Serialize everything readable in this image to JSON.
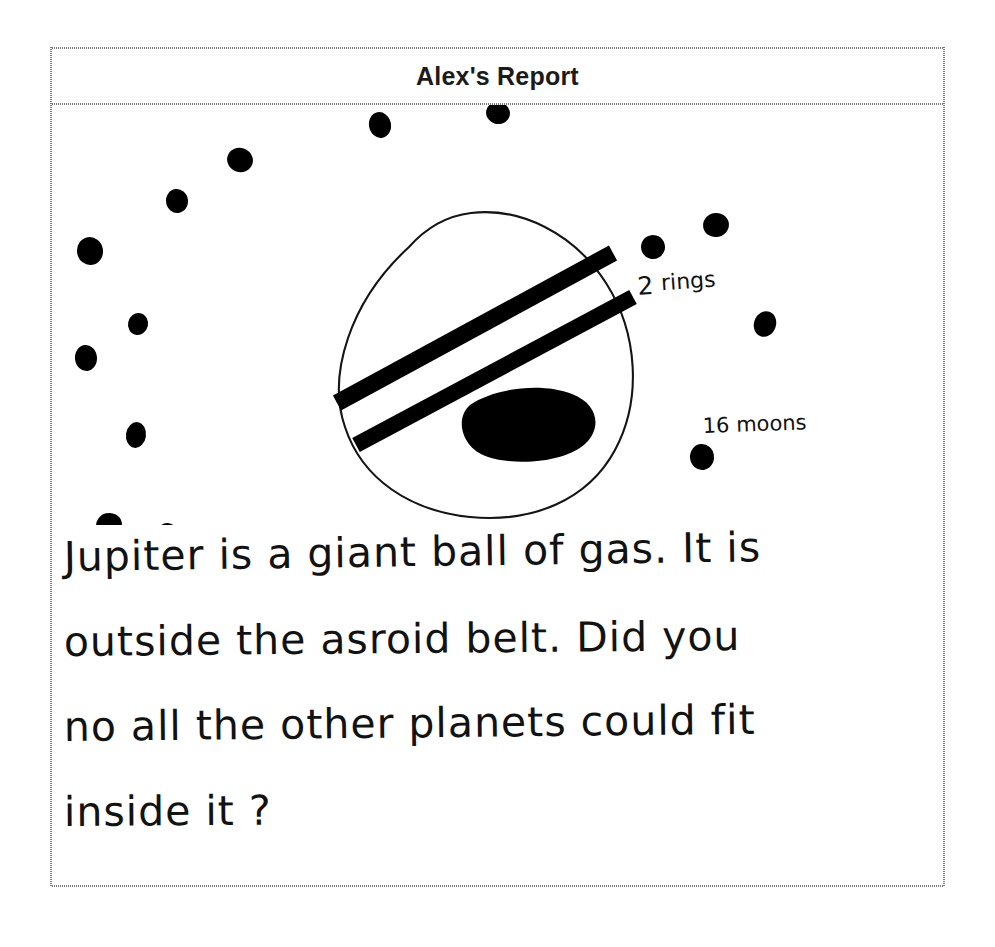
{
  "document": {
    "title": "Alex's Report",
    "type": "handwritten-student-worksheet",
    "subject": "Jupiter"
  },
  "drawing": {
    "name": "jupiter-diagram",
    "planet": {
      "name": "jupiter-body",
      "shape": "hand-drawn-circle",
      "fill": "none",
      "stroke": "#111111"
    },
    "rings": {
      "name": "jupiter-rings",
      "count": 2,
      "style": "thick-diagonal-bands",
      "color": "#000000"
    },
    "great_red_spot": {
      "name": "great-red-spot",
      "shape": "filled-blob",
      "color": "#000000"
    },
    "moons": {
      "name": "moon-dots",
      "count": 16,
      "color": "#000000"
    },
    "annotations": [
      {
        "id": "rings-label",
        "text": "2 rings"
      },
      {
        "id": "moons-label",
        "text": "16 moons"
      }
    ]
  },
  "body": {
    "lines": [
      "Jupiter is a  giant ball of gas.  It is",
      "outside  the  asroid  belt.   Did   you",
      "no  all  the  other planets   could fit",
      "inside it ?"
    ],
    "full_text": "Jupiter is a giant ball of gas. It is outside the asroid belt. Did you no all the other planets could fit inside it ?"
  },
  "colors": {
    "ink": "#111111",
    "page": "#ffffff",
    "rule": "#7a7a7a"
  }
}
